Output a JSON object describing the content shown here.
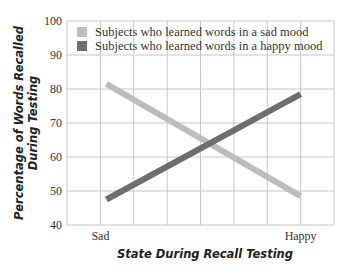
{
  "chart_data": {
    "type": "line",
    "title": "",
    "xlabel": "State During Recall Testing",
    "ylabel": "Percentage of Words Recalled During Testing",
    "ylabel_lines": [
      "Percentage of Words Recalled",
      "During Testing"
    ],
    "categories": [
      "Sad",
      "Happy"
    ],
    "ylim": [
      40,
      100
    ],
    "yticks": [
      40,
      50,
      60,
      70,
      80,
      90,
      100
    ],
    "grid": true,
    "legend_position": "top-left inside",
    "series": [
      {
        "name": "Subjects who learned words in a sad mood",
        "values": [
          81.5,
          48.5
        ],
        "color": "#bdbdbd"
      },
      {
        "name": "Subjects who learned words in a happy mood",
        "values": [
          47.5,
          78.5
        ],
        "color": "#6e6e6e"
      }
    ]
  },
  "legend": {
    "items": [
      {
        "label": "Subjects who learned words in a sad mood",
        "color": "#bdbdbd"
      },
      {
        "label": "Subjects who learned words in a happy mood",
        "color": "#6e6e6e"
      }
    ]
  },
  "axes": {
    "x_title": "State During Recall Testing",
    "y_title_line1": "Percentage of Words Recalled",
    "y_title_line2": "During Testing",
    "x_labels": [
      "Sad",
      "Happy"
    ],
    "y_labels": [
      "100",
      "90",
      "80",
      "70",
      "60",
      "50",
      "40"
    ]
  }
}
